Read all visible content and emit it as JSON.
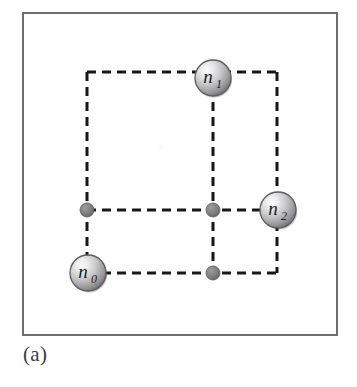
{
  "figure": {
    "caption": "(a)",
    "frame": {
      "x": 22,
      "y": 12,
      "width": 316,
      "height": 324,
      "border_color": "#6f6f72",
      "background": "#fefefe"
    },
    "style": {
      "dash_color": "#17171a",
      "dash_width": 3,
      "dash_length": 9,
      "dash_gap": 6,
      "sphere_rim_color": "#5d5d60",
      "sphere_light": "#f2f2f2",
      "sphere_mid": "#b6b6b8",
      "sphere_dark": "#6e6e71",
      "small_dot_color": "#7b7b7e",
      "small_dot_edge": "#5a5a5d",
      "label_color": "#1c1c1e"
    },
    "grid": {
      "x_lines": [
        87,
        213,
        277
      ],
      "y_lines": [
        72,
        210,
        273
      ]
    },
    "nodes": [
      {
        "id": "n0",
        "label": "n",
        "sub": "0",
        "x": 88,
        "y": 273,
        "r": 18,
        "kind": "sphere"
      },
      {
        "id": "n1",
        "label": "n",
        "sub": "1",
        "x": 213,
        "y": 78,
        "r": 18,
        "kind": "sphere"
      },
      {
        "id": "n2",
        "label": "n",
        "sub": "2",
        "x": 278,
        "y": 210,
        "r": 18,
        "kind": "sphere"
      }
    ],
    "dots": [
      {
        "id": "dot-left-mid",
        "x": 87,
        "y": 210,
        "r": 7
      },
      {
        "id": "dot-center",
        "x": 213,
        "y": 210,
        "r": 7
      },
      {
        "id": "dot-bottom-mid",
        "x": 213,
        "y": 273,
        "r": 7
      }
    ],
    "edges": [
      {
        "id": "edge-top",
        "x1": 87,
        "y1": 72,
        "x2": 277,
        "y2": 72
      },
      {
        "id": "edge-middle",
        "x1": 87,
        "y1": 210,
        "x2": 277,
        "y2": 210
      },
      {
        "id": "edge-bottom",
        "x1": 87,
        "y1": 273,
        "x2": 277,
        "y2": 273
      },
      {
        "id": "edge-left",
        "x1": 87,
        "y1": 72,
        "x2": 87,
        "y2": 273
      },
      {
        "id": "edge-center-vert",
        "x1": 213,
        "y1": 72,
        "x2": 213,
        "y2": 273
      },
      {
        "id": "edge-right",
        "x1": 277,
        "y1": 72,
        "x2": 277,
        "y2": 273
      }
    ]
  }
}
